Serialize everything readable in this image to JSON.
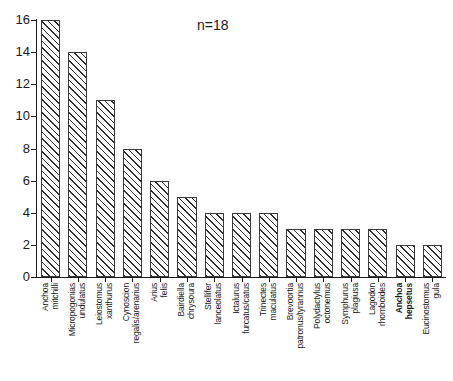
{
  "annotation": {
    "text": "n=18"
  },
  "axes": {
    "y_ticks": [
      "0",
      "2",
      "4",
      "6",
      "8",
      "10",
      "12",
      "14",
      "16"
    ],
    "y_title": "",
    "x_title": ""
  },
  "chart_data": {
    "type": "bar",
    "title": "",
    "subtitle": "",
    "xlabel": "",
    "ylabel": "",
    "ylim": [
      0,
      16
    ],
    "ytick_step": 2,
    "grid": false,
    "legend": "none",
    "annotations": [
      {
        "text": "n=18",
        "x_frac": 0.5,
        "y_value": 15.4
      }
    ],
    "bar_style": {
      "fill": "#ffffff",
      "hatch": "/",
      "hatch_color": "#2e2e2e",
      "edge_color": "#3a3a3a"
    },
    "categories": [
      "Anchoa mitchilli",
      "Micropogonias undulatus",
      "Leiostomus xanthurus",
      "Cynoscion regalis/arenarius",
      "Arius felis",
      "Bairdiella chrysoura",
      "Stellifer lanceolatus",
      "Ictalurus furcatus/catus",
      "Trinectes maculatus",
      "Brevoortia patronus/tyrannus",
      "Polydactylus octonemus",
      "Symphurus plagiusa",
      "Lagodon rhomboides",
      "Anchoa hepsetus",
      "Eucinostomus gula"
    ],
    "values": [
      16,
      14,
      11,
      8,
      6,
      5,
      4,
      4,
      4,
      3,
      3,
      3,
      3,
      2,
      2
    ]
  },
  "categories_display": [
    {
      "line1": "Anchoa",
      "line2": "mitchilli",
      "bold": false
    },
    {
      "line1": "Micropogonias",
      "line2": "undulatus",
      "bold": false
    },
    {
      "line1": "Leiostomus",
      "line2": "xanthurus",
      "bold": false
    },
    {
      "line1": "Cynoscion",
      "line2": "regalis/arenarius",
      "bold": false
    },
    {
      "line1": "Arius",
      "line2": "felis",
      "bold": false
    },
    {
      "line1": "Bairdiella",
      "line2": "chrysoura",
      "bold": false
    },
    {
      "line1": "Stellifer",
      "line2": "lanceolatus",
      "bold": false
    },
    {
      "line1": "Ictalurus",
      "line2": "furcatus/catus",
      "bold": false
    },
    {
      "line1": "Trinectes",
      "line2": "maculatus",
      "bold": false
    },
    {
      "line1": "Brevoortia",
      "line2": "patronus/tyrannus",
      "bold": false
    },
    {
      "line1": "Polydactylus",
      "line2": "octonemus",
      "bold": false
    },
    {
      "line1": "Symphurus",
      "line2": "plagiusa",
      "bold": false
    },
    {
      "line1": "Lagodon",
      "line2": "rhomboides",
      "bold": false
    },
    {
      "line1": "Anchoa",
      "line2": "hepsetus",
      "bold": true
    },
    {
      "line1": "Eucinostomus",
      "line2": "gula",
      "bold": false
    }
  ]
}
